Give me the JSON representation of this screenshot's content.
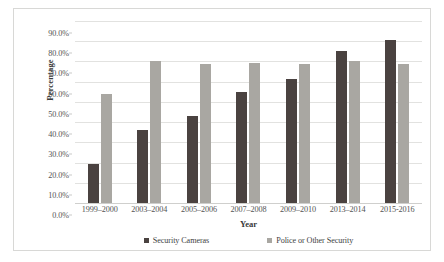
{
  "chart_data": {
    "type": "bar",
    "title": "",
    "xlabel": "Year",
    "ylabel": "Percentage",
    "categories": [
      "1999–2000",
      "2003–2004",
      "2005–2006",
      "2007–2008",
      "2009–2010",
      "2013–2014",
      "2015-2016"
    ],
    "series": [
      {
        "name": "Security Cameras",
        "color": "#4a4240",
        "values": [
          19.4,
          36.0,
          42.8,
          55.0,
          61.4,
          75.0,
          80.6
        ]
      },
      {
        "name": "Police or Other Security",
        "color": "#a9a7a2",
        "values": [
          54.1,
          70.0,
          68.8,
          69.3,
          68.8,
          70.0,
          68.8
        ]
      }
    ],
    "ylim": [
      0,
      90
    ],
    "ytick_values": [
      0,
      10,
      20,
      30,
      40,
      50,
      60,
      70,
      80,
      90
    ],
    "ytick_labels": [
      "0.0%",
      "10.0%",
      "20.0%",
      "30.0%",
      "40.0%",
      "50.0%",
      "60.0%",
      "70.0%",
      "80.0%",
      "90.0%"
    ],
    "grid": true,
    "legend_position": "bottom"
  },
  "axes": {
    "y_title": "Percentage",
    "x_title": "Year"
  },
  "legend": {
    "entries": [
      {
        "label": "Security Cameras"
      },
      {
        "label": "Police or Other Security"
      }
    ]
  }
}
